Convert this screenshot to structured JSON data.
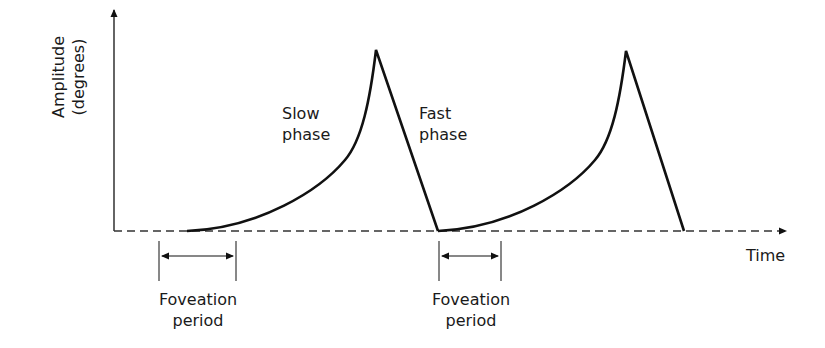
{
  "diagram": {
    "y_axis_label_line1": "Amplitude",
    "y_axis_label_line2": "(degrees)",
    "x_axis_label": "Time",
    "slow_phase_line1": "Slow",
    "slow_phase_line2": "phase",
    "fast_phase_line1": "Fast",
    "fast_phase_line2": "phase",
    "foveation_1_line1": "Foveation",
    "foveation_1_line2": "period",
    "foveation_2_line1": "Foveation",
    "foveation_2_line2": "period",
    "colors": {
      "line": "#111111",
      "text": "#1a1a1a",
      "background": "#ffffff"
    }
  }
}
